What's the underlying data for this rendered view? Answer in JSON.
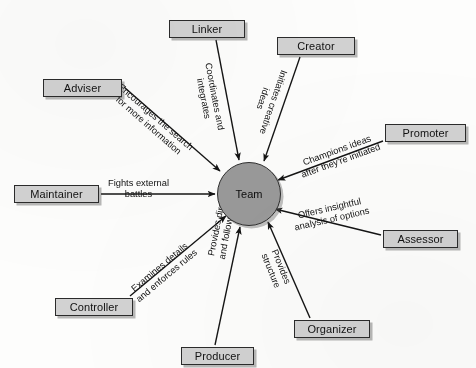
{
  "diagram": {
    "type": "hub-and-spoke",
    "hub": {
      "label": "Team",
      "shape": "circle",
      "fill": "#9a9a9a",
      "stroke": "#2f2f2f",
      "cx": 248,
      "cy": 193,
      "r": 31
    },
    "style": {
      "node_fill": "#d2d2d2",
      "node_stroke": "#2b2b2b",
      "arrow_color": "#141414",
      "background": "#fdfdfc"
    },
    "nodes": [
      {
        "id": "linker",
        "label": "Linker",
        "x": 169,
        "y": 20,
        "w": 76,
        "h": 18
      },
      {
        "id": "creator",
        "label": "Creator",
        "x": 277,
        "y": 37,
        "w": 78,
        "h": 18
      },
      {
        "id": "adviser",
        "label": "Adviser",
        "x": 43,
        "y": 79,
        "w": 79,
        "h": 18
      },
      {
        "id": "promoter",
        "label": "Promoter",
        "x": 385,
        "y": 124,
        "w": 81,
        "h": 18
      },
      {
        "id": "maintainer",
        "label": "Maintainer",
        "x": 14,
        "y": 185,
        "w": 85,
        "h": 18
      },
      {
        "id": "assessor",
        "label": "Assessor",
        "x": 383,
        "y": 230,
        "w": 75,
        "h": 18
      },
      {
        "id": "controller",
        "label": "Controller",
        "x": 55,
        "y": 298,
        "w": 78,
        "h": 18
      },
      {
        "id": "organizer",
        "label": "Organizer",
        "x": 294,
        "y": 320,
        "w": 76,
        "h": 18
      },
      {
        "id": "producer",
        "label": "Producer",
        "x": 181,
        "y": 347,
        "w": 73,
        "h": 18
      }
    ],
    "edges": [
      {
        "id": "edge-linker",
        "from": "linker",
        "to": "hub",
        "label_lines": [
          "Coordinates and",
          "integrates"
        ],
        "x1": 216,
        "y1": 40,
        "x2": 239,
        "y2": 160,
        "label_x": 213,
        "label_y": 62,
        "label_rotate": 79
      },
      {
        "id": "edge-creator",
        "from": "creator",
        "to": "hub",
        "label_lines": [
          "Initiates creative",
          "ideas"
        ],
        "x1": 300,
        "y1": 57,
        "x2": 264,
        "y2": 161,
        "label_x": 289,
        "label_y": 72,
        "label_rotate": 109
      },
      {
        "id": "edge-adviser",
        "from": "adviser",
        "to": "hub",
        "label_lines": [
          "Encourages the search",
          "for more information"
        ],
        "x1": 124,
        "y1": 87,
        "x2": 220,
        "y2": 171,
        "label_x": 123,
        "label_y": 82,
        "label_rotate": 41
      },
      {
        "id": "edge-promoter",
        "from": "promoter",
        "to": "hub",
        "label_lines": [
          "Champions ideas",
          "after they're initiated"
        ],
        "x1": 383,
        "y1": 141,
        "x2": 278,
        "y2": 180,
        "label_x": 296,
        "label_y": 160,
        "label_rotate": -20
      },
      {
        "id": "edge-maintainer",
        "from": "maintainer",
        "to": "hub",
        "label_lines": [
          "Fights external",
          "battles"
        ],
        "x1": 101,
        "y1": 194,
        "x2": 215,
        "y2": 194,
        "label_x": 108,
        "label_y": 178,
        "label_rotate": 0
      },
      {
        "id": "edge-assessor",
        "from": "assessor",
        "to": "hub",
        "label_lines": [
          "Offers insightful",
          "analysis of options"
        ],
        "x1": 381,
        "y1": 235,
        "x2": 275,
        "y2": 209,
        "label_x": 291,
        "label_y": 212,
        "label_rotate": -13
      },
      {
        "id": "edge-controller",
        "from": "controller",
        "to": "hub",
        "label_lines": [
          "Examines details",
          "and enforces rules"
        ],
        "x1": 130,
        "y1": 296,
        "x2": 226,
        "y2": 216,
        "label_x": 127,
        "label_y": 288,
        "label_rotate": -40
      },
      {
        "id": "edge-organizer",
        "from": "organizer",
        "to": "hub",
        "label_lines": [
          "Provides",
          "structure"
        ],
        "x1": 310,
        "y1": 318,
        "x2": 268,
        "y2": 222,
        "label_x": 279,
        "label_y": 248,
        "label_rotate": 68
      },
      {
        "id": "edge-producer",
        "from": "producer",
        "to": "hub",
        "label_lines": [
          "Provides direction",
          "and follow-through"
        ],
        "x1": 215,
        "y1": 345,
        "x2": 240,
        "y2": 227,
        "label_x": 206,
        "label_y": 256,
        "label_rotate": -79
      }
    ]
  }
}
